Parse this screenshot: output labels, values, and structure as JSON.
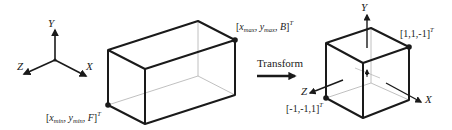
{
  "diagram": {
    "left_axes": {
      "labels": {
        "y": "Y",
        "z": "Z",
        "x": "X"
      }
    },
    "left_box": {
      "corner_top_label": {
        "open": "[",
        "x": "x",
        "x_sub": "max",
        "sep1": ", ",
        "y": "y",
        "y_sub": "max",
        "sep2": ", ",
        "b": "B",
        "close": "]",
        "sup": "T"
      },
      "corner_bottom_label": {
        "open": "[",
        "x": "x",
        "x_sub": "min",
        "sep1": ", ",
        "y": "y",
        "y_sub": "min",
        "sep2": ", ",
        "f": "F",
        "close": "]",
        "sup": "T"
      }
    },
    "transform": {
      "label": "Transform"
    },
    "right_cube": {
      "axes_labels": {
        "y": "Y",
        "z": "Z",
        "x": "X"
      },
      "corner_top_label": {
        "text": "[1,1,-1]",
        "sup": "T"
      },
      "corner_bottom_label": {
        "text": "[-1,-1,1]",
        "sup": "T"
      }
    },
    "colors": {
      "line": "#1a1a1a",
      "hidden_line": "#b0b0b0"
    }
  }
}
